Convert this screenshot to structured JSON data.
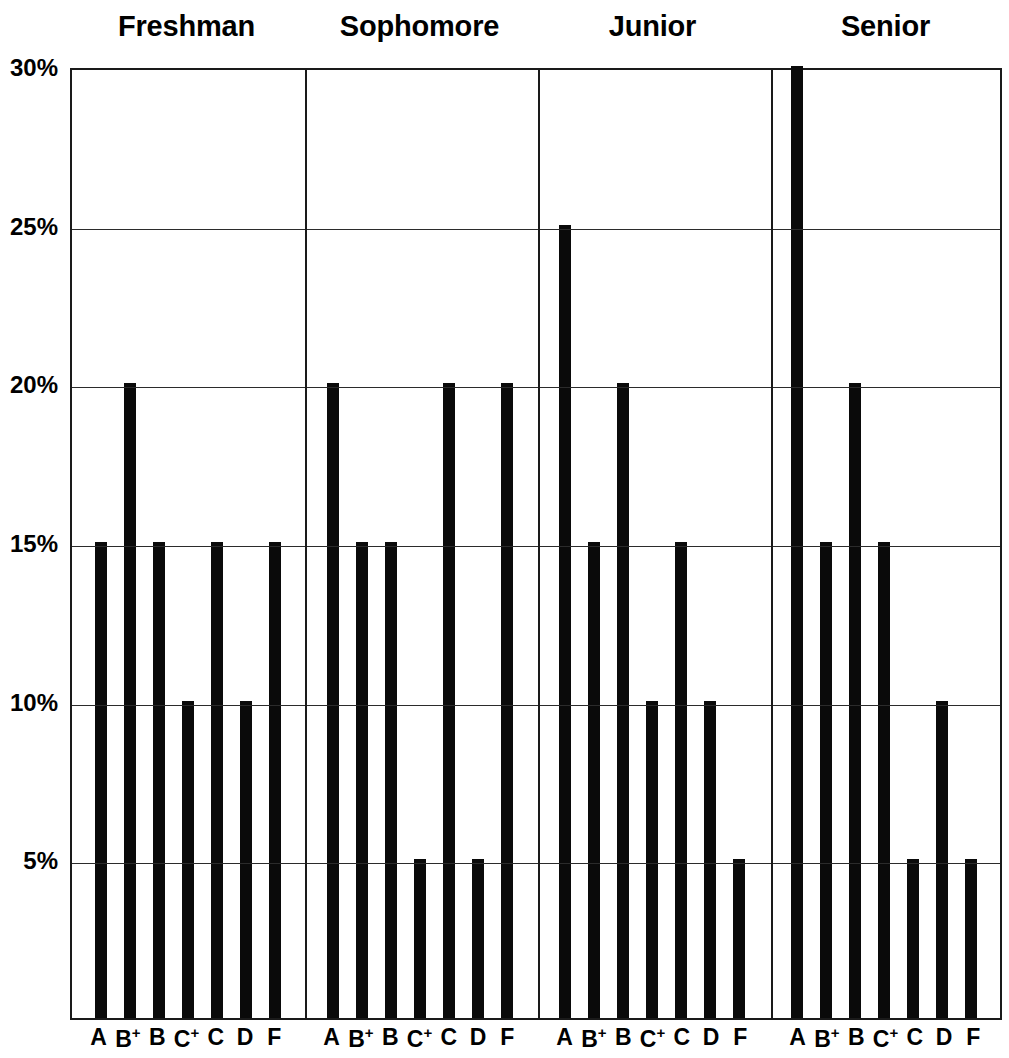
{
  "chart_data": {
    "type": "bar",
    "title": "",
    "subtitle": "",
    "xlabel": "",
    "ylabel": "",
    "ylim": [
      0,
      30
    ],
    "y_tick_labels": [
      "30%",
      "25%",
      "20%",
      "15%",
      "10%",
      "5%"
    ],
    "y_tick_values": [
      30,
      25,
      20,
      15,
      10,
      5
    ],
    "grid": true,
    "legend": "none",
    "bar_color": "#0a0a0a",
    "axis_color": "#1a1a1a",
    "panel_labels": [
      "Freshman",
      "Sophomore",
      "Junior",
      "Senior"
    ],
    "categories": [
      "A",
      "B+",
      "B",
      "C+",
      "C",
      "D",
      "F"
    ],
    "category_labels": [
      {
        "base": "A",
        "sup": ""
      },
      {
        "base": "B",
        "sup": "+"
      },
      {
        "base": "B",
        "sup": ""
      },
      {
        "base": "C",
        "sup": "+"
      },
      {
        "base": "C",
        "sup": ""
      },
      {
        "base": "D",
        "sup": ""
      },
      {
        "base": "F",
        "sup": ""
      }
    ],
    "series": [
      {
        "name": "Freshman",
        "values": [
          15,
          20,
          15,
          10,
          15,
          10,
          15
        ]
      },
      {
        "name": "Sophomore",
        "values": [
          20,
          15,
          15,
          5,
          20,
          5,
          20
        ]
      },
      {
        "name": "Junior",
        "values": [
          25,
          15,
          20,
          10,
          15,
          10,
          5
        ]
      },
      {
        "name": "Senior",
        "values": [
          30,
          15,
          20,
          15,
          5,
          10,
          5
        ]
      }
    ]
  }
}
